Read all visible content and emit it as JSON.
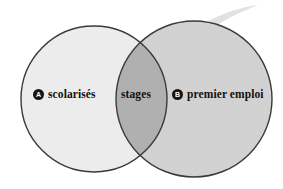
{
  "figure": {
    "type": "venn-diagram",
    "background_color": "#ffffff",
    "width": 283,
    "height": 189
  },
  "sets": {
    "left": {
      "badge": "A",
      "label": "scolarisés",
      "fill_color": "#ececec",
      "stroke_color": "#3a3a3a",
      "center_x": 94,
      "center_y": 99,
      "radius": 73
    },
    "right": {
      "badge": "B",
      "label": "premier emploi",
      "fill_color": "#d3d3d3",
      "stroke_color": "#3a3a3a",
      "center_x": 194,
      "center_y": 99,
      "radius": 78
    },
    "intersection": {
      "label": "stages",
      "fill_color": "#b0b0b0"
    }
  },
  "decoration": {
    "swoosh_color": "#dcdcdc"
  }
}
